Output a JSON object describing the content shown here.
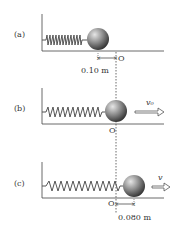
{
  "panels": [
    {
      "label": "(a)",
      "distance_label": "0.10 m",
      "origin_label": "O",
      "velocity_label": ""
    },
    {
      "label": "(b)",
      "distance_label": "",
      "origin_label": "O",
      "velocity_label": "v₀"
    },
    {
      "label": "(c)",
      "distance_label": "0.080 m",
      "origin_label": "O",
      "velocity_label": "v"
    }
  ],
  "colors": {
    "ink": "#333333",
    "ball_light": "#d8d8d8",
    "ball_dark": "#3a3a3a",
    "spring": "#555555"
  }
}
